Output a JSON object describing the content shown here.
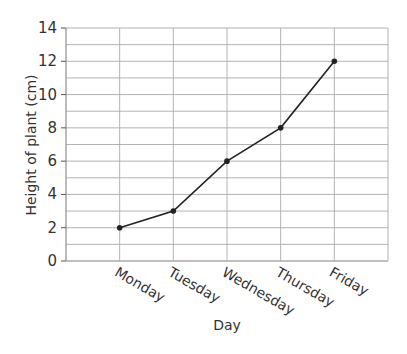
{
  "chart_data": {
    "type": "line",
    "title": "",
    "xlabel": "Day",
    "ylabel": "Height of plant (cm)",
    "categories": [
      "Monday",
      "Tuesday",
      "Wednesday",
      "Thursday",
      "Friday"
    ],
    "values": [
      2,
      3,
      6,
      8,
      12
    ],
    "ylim": [
      0,
      14
    ],
    "yticks": [
      0,
      2,
      4,
      6,
      8,
      10,
      12,
      14
    ],
    "grid": true,
    "legend": null,
    "line_color": "#222222",
    "grid_color": "#aaaaaa"
  }
}
